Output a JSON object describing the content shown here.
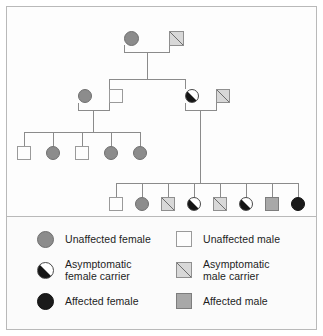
{
  "figure": {
    "type": "pedigree-chart",
    "title": "",
    "border_color": "#b9b9b9",
    "line_color": "#8b8b8b"
  },
  "symbol_types": {
    "female_unaffected": {
      "key": "fem-unaff",
      "shape": "circle",
      "fill": "#8c8c8c",
      "label": "Unaffected female"
    },
    "female_carrier": {
      "key": "fem-carr",
      "shape": "circle",
      "fill": "half-black-diagonal",
      "label": "Asymptomatic female carrier"
    },
    "female_affected": {
      "key": "fem-aff",
      "shape": "circle",
      "fill": "#1a1a1a",
      "label": "Affected female"
    },
    "male_unaffected": {
      "key": "mal-unaff",
      "shape": "square",
      "fill": "#fdfdfd",
      "label": "Unaffected male"
    },
    "male_carrier": {
      "key": "mal-carr",
      "shape": "square",
      "fill": "diagonal-stroke",
      "label": "Asymptomatic male carrier"
    },
    "male_affected": {
      "key": "mal-aff",
      "shape": "square",
      "fill": "#a8a8a8",
      "label": "Affected male"
    }
  },
  "pedigree": {
    "generations": [
      {
        "id": "generation-1",
        "members": [
          {
            "id": "I-1",
            "sex": "female",
            "status": "female_unaffected",
            "x": 124,
            "y": 31
          },
          {
            "id": "I-2",
            "sex": "male",
            "status": "male_carrier",
            "x": 169,
            "y": 31
          }
        ]
      },
      {
        "id": "generation-2",
        "members": [
          {
            "id": "II-1",
            "sex": "female",
            "status": "female_unaffected",
            "x": 78,
            "y": 89
          },
          {
            "id": "II-2",
            "sex": "male",
            "status": "male_unaffected",
            "x": 109,
            "y": 89
          },
          {
            "id": "II-3",
            "sex": "female",
            "status": "female_carrier",
            "x": 185,
            "y": 89
          },
          {
            "id": "II-4",
            "sex": "male",
            "status": "male_carrier",
            "x": 216,
            "y": 89
          }
        ]
      },
      {
        "id": "generation-3-left",
        "members": [
          {
            "id": "III-1",
            "sex": "male",
            "status": "male_unaffected",
            "x": 24,
            "y": 146
          },
          {
            "id": "III-2",
            "sex": "female",
            "status": "female_unaffected",
            "x": 53,
            "y": 146
          },
          {
            "id": "III-3",
            "sex": "male",
            "status": "male_unaffected",
            "x": 82,
            "y": 146
          },
          {
            "id": "III-4",
            "sex": "female",
            "status": "female_unaffected",
            "x": 111,
            "y": 146
          },
          {
            "id": "III-5",
            "sex": "female",
            "status": "female_unaffected",
            "x": 140,
            "y": 146
          }
        ]
      },
      {
        "id": "generation-3-right",
        "members": [
          {
            "id": "III-6",
            "sex": "male",
            "status": "male_unaffected",
            "x": 116,
            "y": 197
          },
          {
            "id": "III-7",
            "sex": "female",
            "status": "female_unaffected",
            "x": 142,
            "y": 197
          },
          {
            "id": "III-8",
            "sex": "male",
            "status": "male_carrier",
            "x": 168,
            "y": 197
          },
          {
            "id": "III-9",
            "sex": "female",
            "status": "female_carrier",
            "x": 194,
            "y": 197
          },
          {
            "id": "III-10",
            "sex": "male",
            "status": "male_carrier",
            "x": 220,
            "y": 197
          },
          {
            "id": "III-11",
            "sex": "female",
            "status": "female_carrier",
            "x": 246,
            "y": 197
          },
          {
            "id": "III-12",
            "sex": "male",
            "status": "male_affected",
            "x": 272,
            "y": 197
          },
          {
            "id": "III-13",
            "sex": "female",
            "status": "female_affected",
            "x": 298,
            "y": 197
          }
        ]
      }
    ]
  },
  "legend": {
    "left_column": [
      {
        "swatch": "female_unaffected",
        "label": "Unaffected female"
      },
      {
        "swatch": "female_carrier",
        "label": "Asymptomatic\nfemale carrier"
      },
      {
        "swatch": "female_affected",
        "label": "Affected female"
      }
    ],
    "right_column": [
      {
        "swatch": "male_unaffected",
        "label": "Unaffected male"
      },
      {
        "swatch": "male_carrier",
        "label": "Asymptomatic\nmale carrier"
      },
      {
        "swatch": "male_affected",
        "label": "Affected male"
      }
    ]
  }
}
